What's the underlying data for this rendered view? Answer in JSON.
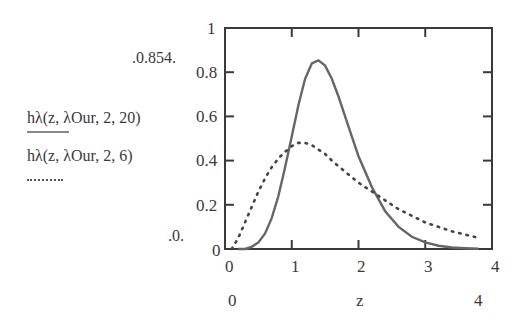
{
  "chart_data": {
    "type": "line",
    "title": "",
    "xlabel": "z",
    "ylabel": "",
    "xlim": [
      0,
      4
    ],
    "ylim": [
      0,
      1
    ],
    "grid": false,
    "x_ticks": [
      "0",
      "1",
      "2",
      "3",
      "4"
    ],
    "y_ticks": [
      "0",
      "0.2",
      "0.4",
      "0.6",
      "0.8",
      "1"
    ],
    "x_range_labels": {
      "min": "0",
      "max": "4"
    },
    "y_range_labels": {
      "max": ".0.854.",
      "min": ".0."
    },
    "legend_position": "left",
    "series": [
      {
        "name": "hλ(z, λOur, 2, 20)",
        "style": "solid",
        "x": [
          0.2,
          0.3,
          0.4,
          0.5,
          0.6,
          0.7,
          0.8,
          0.9,
          1.0,
          1.1,
          1.2,
          1.3,
          1.4,
          1.5,
          1.6,
          1.7,
          1.8,
          1.9,
          2.0,
          2.2,
          2.4,
          2.6,
          2.8,
          3.0,
          3.2,
          3.4,
          3.6,
          3.8
        ],
        "y": [
          0.0,
          0.0,
          0.01,
          0.03,
          0.07,
          0.14,
          0.24,
          0.37,
          0.51,
          0.65,
          0.77,
          0.84,
          0.854,
          0.83,
          0.77,
          0.69,
          0.6,
          0.51,
          0.42,
          0.28,
          0.17,
          0.1,
          0.055,
          0.03,
          0.015,
          0.007,
          0.003,
          0.001
        ]
      },
      {
        "name": "hλ(z, λOur, 2, 6)",
        "style": "dotted",
        "x": [
          0.1,
          0.2,
          0.3,
          0.4,
          0.5,
          0.6,
          0.7,
          0.8,
          0.9,
          1.0,
          1.1,
          1.2,
          1.3,
          1.4,
          1.5,
          1.6,
          1.8,
          2.0,
          2.2,
          2.4,
          2.6,
          2.8,
          3.0,
          3.2,
          3.4,
          3.6,
          3.8
        ],
        "y": [
          0.0,
          0.05,
          0.12,
          0.19,
          0.26,
          0.32,
          0.37,
          0.41,
          0.44,
          0.465,
          0.48,
          0.48,
          0.47,
          0.45,
          0.43,
          0.4,
          0.35,
          0.3,
          0.26,
          0.22,
          0.18,
          0.15,
          0.12,
          0.1,
          0.08,
          0.065,
          0.05
        ]
      }
    ]
  },
  "legend": {
    "items": [
      {
        "label": "hλ(z, λOur, 2, 20)",
        "style": "solid"
      },
      {
        "label": "hλ(z, λOur, 2, 6)",
        "style": "dotted"
      }
    ]
  },
  "colors": {
    "line": "#555555",
    "axis": "#3a3a3a"
  }
}
